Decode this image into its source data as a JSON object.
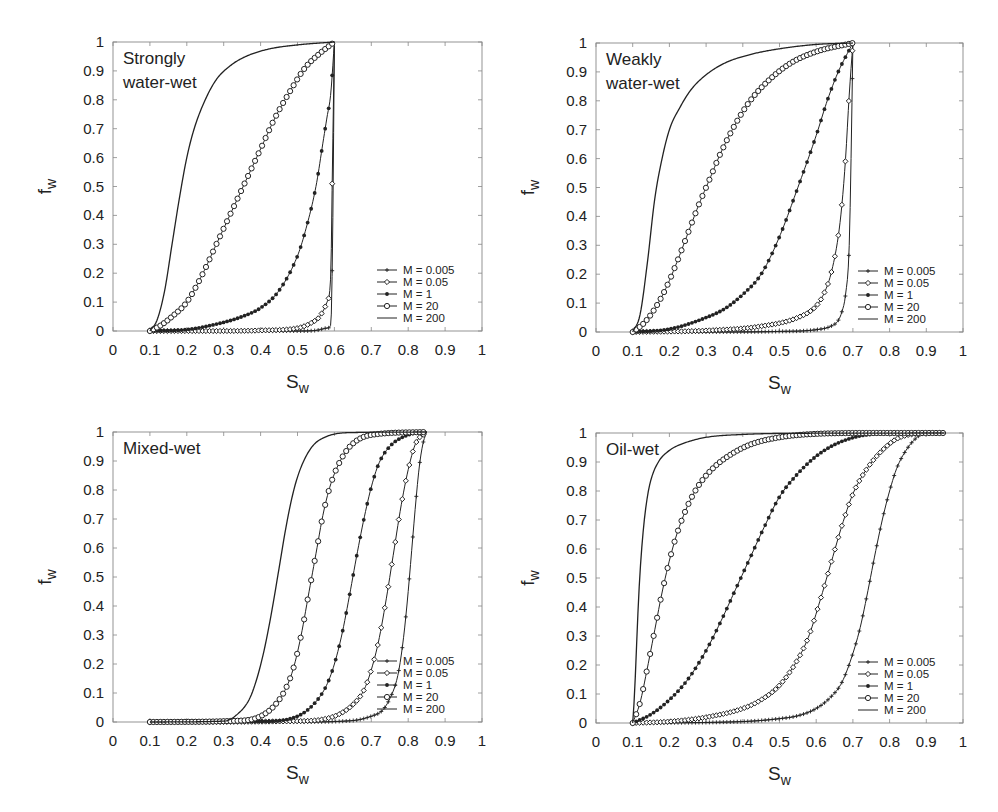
{
  "figure": {
    "panels_count": 4,
    "axis_color": "#888888",
    "curve_color": "#222222"
  },
  "chart_data": [
    {
      "type": "line",
      "title": "Strongly water-wet",
      "title_lines": [
        "Strongly",
        "water-wet"
      ],
      "xlabel": "Sw",
      "ylabel": "fw",
      "xlim": [
        0,
        1
      ],
      "ylim": [
        0,
        1
      ],
      "xticks": [
        "0",
        "0.1",
        "0.2",
        "0.3",
        "0.4",
        "0.5",
        "0.6",
        "0.7",
        "0.8",
        "0.9",
        "1"
      ],
      "yticks": [
        "0",
        "0.1",
        "0.2",
        "0.3",
        "0.4",
        "0.5",
        "0.6",
        "0.7",
        "0.8",
        "0.9",
        "1"
      ],
      "grid": false,
      "legend_position": "lower right",
      "box": {
        "left": 113,
        "top": 42,
        "right": 482,
        "bottom": 331
      },
      "series": [
        {
          "name": "M = 0.005",
          "marker": "plus",
          "x": [
            0.1,
            0.2,
            0.3,
            0.4,
            0.5,
            0.55,
            0.58,
            0.59,
            0.595,
            0.6
          ],
          "y": [
            0.0,
            0.0,
            0.0,
            0.0,
            0.0,
            0.002,
            0.01,
            0.02,
            0.3,
            1.0
          ]
        },
        {
          "name": "M = 0.05",
          "marker": "open-diamond",
          "x": [
            0.1,
            0.2,
            0.3,
            0.4,
            0.5,
            0.54,
            0.56,
            0.58,
            0.59,
            0.595,
            0.6
          ],
          "y": [
            0.0,
            0.0,
            0.0,
            0.002,
            0.01,
            0.03,
            0.05,
            0.1,
            0.19,
            0.6,
            1.0
          ]
        },
        {
          "name": "M = 1",
          "marker": "filled-circle",
          "x": [
            0.1,
            0.2,
            0.3,
            0.35,
            0.4,
            0.45,
            0.5,
            0.52,
            0.55,
            0.57,
            0.58,
            0.59,
            0.6
          ],
          "y": [
            0.0,
            0.005,
            0.03,
            0.05,
            0.08,
            0.14,
            0.26,
            0.34,
            0.5,
            0.66,
            0.74,
            0.82,
            1.0
          ]
        },
        {
          "name": "M = 20",
          "marker": "open-circle",
          "x": [
            0.1,
            0.13,
            0.16,
            0.2,
            0.24,
            0.28,
            0.32,
            0.36,
            0.4,
            0.44,
            0.48,
            0.52,
            0.56,
            0.6
          ],
          "y": [
            0.0,
            0.02,
            0.05,
            0.1,
            0.19,
            0.3,
            0.41,
            0.52,
            0.63,
            0.74,
            0.83,
            0.91,
            0.96,
            1.0
          ]
        },
        {
          "name": "M = 200",
          "marker": "none",
          "x": [
            0.1,
            0.12,
            0.14,
            0.16,
            0.18,
            0.2,
            0.22,
            0.25,
            0.28,
            0.32,
            0.36,
            0.42,
            0.5,
            0.6
          ],
          "y": [
            0.0,
            0.04,
            0.14,
            0.3,
            0.46,
            0.6,
            0.7,
            0.8,
            0.87,
            0.92,
            0.95,
            0.975,
            0.99,
            1.0
          ]
        }
      ]
    },
    {
      "type": "line",
      "title": "Weakly water-wet",
      "title_lines": [
        "Weakly",
        "water-wet"
      ],
      "xlabel": "Sw",
      "ylabel": "fw",
      "xlim": [
        0,
        1
      ],
      "ylim": [
        0,
        1
      ],
      "xticks": [
        "0",
        "0.1",
        "0.2",
        "0.3",
        "0.4",
        "0.5",
        "0.6",
        "0.7",
        "0.8",
        "0.9",
        "1"
      ],
      "yticks": [
        "0",
        "0.1",
        "0.2",
        "0.3",
        "0.4",
        "0.5",
        "0.6",
        "0.7",
        "0.8",
        "0.9",
        "1"
      ],
      "grid": false,
      "legend_position": "lower right",
      "box": {
        "left": 596,
        "top": 43,
        "right": 963,
        "bottom": 332
      },
      "series": [
        {
          "name": "M = 0.005",
          "marker": "plus",
          "x": [
            0.1,
            0.3,
            0.5,
            0.6,
            0.64,
            0.66,
            0.67,
            0.68,
            0.69,
            0.695,
            0.7
          ],
          "y": [
            0.0,
            0.0,
            0.002,
            0.008,
            0.02,
            0.04,
            0.07,
            0.13,
            0.3,
            0.6,
            1.0
          ]
        },
        {
          "name": "M = 0.05",
          "marker": "open-diamond",
          "x": [
            0.1,
            0.3,
            0.45,
            0.55,
            0.6,
            0.62,
            0.64,
            0.66,
            0.67,
            0.68,
            0.69,
            0.7
          ],
          "y": [
            0.0,
            0.005,
            0.02,
            0.05,
            0.09,
            0.13,
            0.2,
            0.33,
            0.44,
            0.6,
            0.82,
            1.0
          ]
        },
        {
          "name": "M = 1",
          "marker": "filled-circle",
          "x": [
            0.1,
            0.2,
            0.3,
            0.35,
            0.4,
            0.45,
            0.5,
            0.55,
            0.6,
            0.63,
            0.66,
            0.7
          ],
          "y": [
            0.0,
            0.01,
            0.05,
            0.08,
            0.13,
            0.2,
            0.33,
            0.5,
            0.68,
            0.8,
            0.9,
            1.0
          ]
        },
        {
          "name": "M = 20",
          "marker": "open-circle",
          "x": [
            0.1,
            0.13,
            0.16,
            0.19,
            0.22,
            0.25,
            0.28,
            0.31,
            0.34,
            0.38,
            0.42,
            0.47,
            0.53,
            0.6,
            0.7
          ],
          "y": [
            0.0,
            0.03,
            0.08,
            0.15,
            0.24,
            0.34,
            0.44,
            0.53,
            0.62,
            0.72,
            0.8,
            0.87,
            0.93,
            0.97,
            1.0
          ]
        },
        {
          "name": "M = 200",
          "marker": "none",
          "x": [
            0.1,
            0.12,
            0.14,
            0.16,
            0.18,
            0.2,
            0.23,
            0.26,
            0.3,
            0.35,
            0.42,
            0.5,
            0.6,
            0.7
          ],
          "y": [
            0.0,
            0.06,
            0.24,
            0.46,
            0.6,
            0.7,
            0.78,
            0.84,
            0.89,
            0.93,
            0.96,
            0.98,
            0.995,
            1.0
          ]
        }
      ]
    },
    {
      "type": "line",
      "title": "Mixed-wet",
      "title_lines": [
        "Mixed-wet"
      ],
      "xlabel": "Sw",
      "ylabel": "fw",
      "xlim": [
        0,
        1
      ],
      "ylim": [
        0,
        1
      ],
      "xticks": [
        "0",
        "0.1",
        "0.2",
        "0.3",
        "0.4",
        "0.5",
        "0.6",
        "0.7",
        "0.8",
        "0.9",
        "1"
      ],
      "yticks": [
        "0",
        "0.1",
        "0.2",
        "0.3",
        "0.4",
        "0.5",
        "0.6",
        "0.7",
        "0.8",
        "0.9",
        "1"
      ],
      "grid": false,
      "legend_position": "lower right",
      "box": {
        "left": 113,
        "top": 432,
        "right": 482,
        "bottom": 722
      },
      "series": [
        {
          "name": "M = 0.005",
          "marker": "plus",
          "x": [
            0.1,
            0.5,
            0.65,
            0.7,
            0.73,
            0.75,
            0.77,
            0.78,
            0.79,
            0.8,
            0.81,
            0.82,
            0.83,
            0.84,
            0.85
          ],
          "y": [
            0.0,
            0.0,
            0.005,
            0.02,
            0.04,
            0.08,
            0.15,
            0.22,
            0.32,
            0.45,
            0.6,
            0.75,
            0.88,
            0.96,
            1.0
          ]
        },
        {
          "name": "M = 0.05",
          "marker": "open-diamond",
          "x": [
            0.1,
            0.5,
            0.6,
            0.65,
            0.68,
            0.7,
            0.72,
            0.74,
            0.76,
            0.78,
            0.8,
            0.82,
            0.85
          ],
          "y": [
            0.0,
            0.003,
            0.02,
            0.06,
            0.11,
            0.18,
            0.28,
            0.42,
            0.58,
            0.74,
            0.87,
            0.96,
            1.0
          ]
        },
        {
          "name": "M = 1",
          "marker": "filled-circle",
          "x": [
            0.1,
            0.4,
            0.5,
            0.55,
            0.58,
            0.6,
            0.62,
            0.64,
            0.66,
            0.68,
            0.7,
            0.72,
            0.75,
            0.8,
            0.85
          ],
          "y": [
            0.0,
            0.002,
            0.02,
            0.07,
            0.13,
            0.2,
            0.3,
            0.43,
            0.57,
            0.7,
            0.81,
            0.89,
            0.95,
            0.99,
            1.0
          ]
        },
        {
          "name": "M = 20",
          "marker": "open-circle",
          "x": [
            0.1,
            0.35,
            0.4,
            0.44,
            0.47,
            0.49,
            0.51,
            0.53,
            0.55,
            0.57,
            0.59,
            0.62,
            0.65,
            0.7,
            0.85
          ],
          "y": [
            0.0,
            0.005,
            0.02,
            0.06,
            0.12,
            0.19,
            0.3,
            0.44,
            0.58,
            0.72,
            0.82,
            0.91,
            0.96,
            0.99,
            1.0
          ]
        },
        {
          "name": "M = 200",
          "marker": "none",
          "x": [
            0.1,
            0.3,
            0.34,
            0.37,
            0.39,
            0.41,
            0.43,
            0.45,
            0.47,
            0.49,
            0.51,
            0.54,
            0.58,
            0.65,
            0.85
          ],
          "y": [
            0.0,
            0.003,
            0.03,
            0.08,
            0.15,
            0.25,
            0.38,
            0.53,
            0.68,
            0.8,
            0.88,
            0.95,
            0.985,
            0.998,
            1.0
          ]
        }
      ]
    },
    {
      "type": "line",
      "title": "Oil-wet",
      "title_lines": [
        "Oil-wet"
      ],
      "xlabel": "Sw",
      "ylabel": "fw",
      "xlim": [
        0,
        1
      ],
      "ylim": [
        0,
        1
      ],
      "xticks": [
        "0",
        "0.1",
        "0.2",
        "0.3",
        "0.4",
        "0.5",
        "0.6",
        "0.7",
        "0.8",
        "0.9",
        "1"
      ],
      "yticks": [
        "0",
        "0.1",
        "0.2",
        "0.3",
        "0.4",
        "0.5",
        "0.6",
        "0.7",
        "0.8",
        "0.9",
        "1"
      ],
      "grid": false,
      "legend_position": "lower right",
      "box": {
        "left": 596,
        "top": 433,
        "right": 963,
        "bottom": 723
      },
      "series": [
        {
          "name": "M = 0.005",
          "marker": "plus",
          "x": [
            0.1,
            0.4,
            0.5,
            0.55,
            0.6,
            0.64,
            0.67,
            0.7,
            0.72,
            0.74,
            0.76,
            0.78,
            0.8,
            0.82,
            0.85,
            0.88,
            0.9,
            0.95
          ],
          "y": [
            0.0,
            0.005,
            0.015,
            0.025,
            0.05,
            0.09,
            0.14,
            0.24,
            0.33,
            0.45,
            0.58,
            0.7,
            0.8,
            0.88,
            0.95,
            0.99,
            1.0,
            1.0
          ]
        },
        {
          "name": "M = 0.05",
          "marker": "open-diamond",
          "x": [
            0.1,
            0.2,
            0.3,
            0.4,
            0.45,
            0.5,
            0.55,
            0.58,
            0.61,
            0.64,
            0.67,
            0.7,
            0.74,
            0.78,
            0.82,
            0.88,
            0.95
          ],
          "y": [
            0.0,
            0.005,
            0.02,
            0.05,
            0.08,
            0.13,
            0.22,
            0.3,
            0.42,
            0.55,
            0.68,
            0.79,
            0.88,
            0.94,
            0.98,
            0.998,
            1.0
          ]
        },
        {
          "name": "M = 1",
          "marker": "filled-circle",
          "x": [
            0.1,
            0.15,
            0.2,
            0.25,
            0.3,
            0.34,
            0.38,
            0.42,
            0.46,
            0.5,
            0.55,
            0.6,
            0.65,
            0.72,
            0.8,
            0.95
          ],
          "y": [
            0.0,
            0.03,
            0.08,
            0.15,
            0.25,
            0.35,
            0.46,
            0.57,
            0.68,
            0.78,
            0.86,
            0.92,
            0.96,
            0.99,
            0.998,
            1.0
          ]
        },
        {
          "name": "M = 20",
          "marker": "open-circle",
          "x": [
            0.1,
            0.12,
            0.14,
            0.16,
            0.18,
            0.2,
            0.22,
            0.25,
            0.28,
            0.32,
            0.36,
            0.42,
            0.5,
            0.6,
            0.75,
            0.95
          ],
          "y": [
            0.0,
            0.07,
            0.19,
            0.32,
            0.45,
            0.56,
            0.65,
            0.75,
            0.82,
            0.88,
            0.92,
            0.96,
            0.985,
            0.997,
            1.0,
            1.0
          ]
        },
        {
          "name": "M = 200",
          "marker": "none",
          "x": [
            0.1,
            0.105,
            0.11,
            0.115,
            0.12,
            0.13,
            0.14,
            0.15,
            0.17,
            0.2,
            0.24,
            0.3,
            0.4,
            0.55,
            0.95
          ],
          "y": [
            0.0,
            0.1,
            0.25,
            0.4,
            0.52,
            0.68,
            0.78,
            0.84,
            0.9,
            0.94,
            0.965,
            0.985,
            0.995,
            0.999,
            1.0
          ]
        }
      ]
    }
  ]
}
